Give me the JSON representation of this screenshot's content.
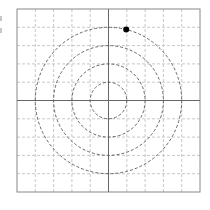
{
  "diagram": {
    "type": "polar-grid",
    "grid": {
      "cells_x": 10,
      "cells_y": 10,
      "line_color": "#c8c8c8",
      "line_style": "dashed",
      "border_color": "#888888"
    },
    "axes": {
      "color": "#666666",
      "style": "solid"
    },
    "circles": {
      "radii_in_cells": [
        1,
        2,
        3,
        4
      ],
      "color": "#555555",
      "style": "dashed"
    },
    "point": {
      "radius_cells": 4,
      "angle_deg": 76,
      "color": "#000000"
    },
    "clipped_label_marks": 2
  }
}
